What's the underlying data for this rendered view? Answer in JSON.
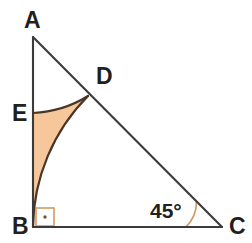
{
  "figure": {
    "canvas": {
      "width": 252,
      "height": 243,
      "background": "#ffffff"
    },
    "colors": {
      "stroke": "#3c3b3a",
      "arc_stroke": "#4a3527",
      "shade_fill": "#f6c79b",
      "marker": "#d09a63",
      "label": "#231f20"
    },
    "points": {
      "A": {
        "label": "A",
        "x": 33,
        "y": 37,
        "label_x": 24,
        "label_y": 28
      },
      "B": {
        "label": "B",
        "x": 33,
        "y": 227,
        "label_x": 12,
        "label_y": 234
      },
      "C": {
        "label": "C",
        "x": 222,
        "y": 227,
        "label_x": 229,
        "label_y": 234
      },
      "D": {
        "label": "D",
        "x": 88,
        "y": 96,
        "label_x": 96,
        "label_y": 84
      },
      "E": {
        "label": "E",
        "x": 33,
        "y": 113,
        "label_x": 12,
        "label_y": 121
      }
    },
    "segments": [
      {
        "name": "side-AB",
        "from": "A",
        "to": "B"
      },
      {
        "name": "side-BC",
        "from": "B",
        "to": "C"
      },
      {
        "name": "hypotenuse-AC",
        "from": "A",
        "to": "C"
      }
    ],
    "arcs": [
      {
        "name": "arc-B-to-D",
        "center": "C",
        "radius": 189,
        "from": "B",
        "to": "D",
        "description": "arc centered at C from B to D"
      },
      {
        "name": "arc-D-to-E",
        "center": "B",
        "radius": 114,
        "from": "D",
        "to": "E",
        "description": "arc centered at B from D to E"
      }
    ],
    "shaded_region": {
      "name": "shaded-curvilinear-triangle",
      "vertices": [
        "E",
        "B",
        "D"
      ],
      "fill": "#f6c79b",
      "path": "M 33 113 L 33 227 A 189 189 0 0 1 88 96 A 114 114 0 0 1 33 113 Z"
    },
    "angles": {
      "right_angle": {
        "at": "B",
        "label": "",
        "marker": "square-with-dot",
        "size": 18
      },
      "marked_angle": {
        "at": "C",
        "value": "45°",
        "label_x": 150,
        "label_y": 218,
        "arc_radius": 36
      }
    }
  }
}
